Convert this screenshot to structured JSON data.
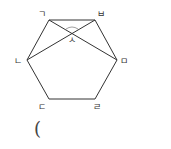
{
  "diagram": {
    "shape": "regular-hexagon",
    "stroke_color": "#333333",
    "vertices": [
      {
        "label": "ㄱ",
        "x": 49,
        "y": 20
      },
      {
        "label": "ㅂ",
        "x": 95,
        "y": 20
      },
      {
        "label": "ㅁ",
        "x": 117,
        "y": 60
      },
      {
        "label": "ㄹ",
        "x": 95,
        "y": 99
      },
      {
        "label": "ㄷ",
        "x": 49,
        "y": 99
      },
      {
        "label": "ㄴ",
        "x": 27,
        "y": 60
      }
    ],
    "diagonals": [
      {
        "from": "ㄱ",
        "to": "ㅁ"
      },
      {
        "from": "ㄴ",
        "to": "ㅂ"
      }
    ],
    "intersection": {
      "label": "ㅅ",
      "x": 72,
      "y": 33,
      "angle_marked": true
    },
    "labels": {
      "g": "ㄱ",
      "b": "ㅂ",
      "m": "ㅁ",
      "r": "ㄹ",
      "d": "ㄷ",
      "n": "ㄴ",
      "s": "ㅅ"
    }
  },
  "answer": {
    "open_paren": "("
  }
}
